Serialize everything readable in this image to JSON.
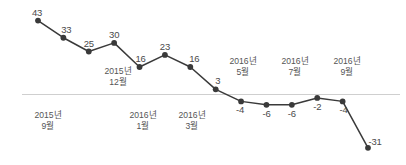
{
  "chart_data": {
    "type": "line",
    "title": "",
    "subtitle": "",
    "xlabel": "",
    "ylabel": "",
    "grid": false,
    "legend": "none",
    "zero_line": true,
    "series_color": "#3a3a3a",
    "zero_line_color": "#cfcfcf",
    "ylim": [
      -35,
      48
    ],
    "categories": [
      "2015년 9월",
      "2015년 10월",
      "2015년 11월",
      "2015년 12월",
      "2016년 1월",
      "2016년 2월",
      "2016년 3월",
      "2016년 4월",
      "2016년 5월",
      "2016년 6월",
      "2016년 7월",
      "2016년 8월",
      "2016년 9월",
      "2016년 10월"
    ],
    "values": [
      43,
      33,
      25,
      30,
      16,
      23,
      16,
      3,
      -4,
      -6,
      -6,
      -2,
      -4,
      -31
    ],
    "point_labels": [
      "43",
      "33",
      "25",
      "30",
      "16",
      "23",
      "16",
      "3",
      "-4",
      "-6",
      "-6",
      "-2",
      "-4",
      "-31"
    ],
    "tick_labels": [
      {
        "year": "2015년",
        "month": "9월"
      },
      {
        "year": "2015년",
        "month": "12월"
      },
      {
        "year": "2016년",
        "month": "1월"
      },
      {
        "year": "2016년",
        "month": "3월"
      },
      {
        "year": "2016년",
        "month": "5월"
      },
      {
        "year": "2016년",
        "month": "7월"
      },
      {
        "year": "2016년",
        "month": "9월"
      }
    ]
  }
}
